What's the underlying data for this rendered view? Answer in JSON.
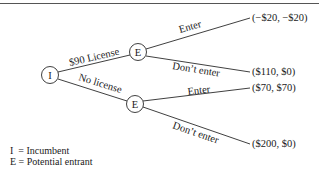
{
  "diagram": {
    "type": "game-tree",
    "nodes": {
      "root": {
        "label": "I"
      },
      "upper": {
        "label": "E"
      },
      "lower": {
        "label": "E"
      }
    },
    "branches": {
      "license": "$90 License",
      "no_license": "No license",
      "upper_enter": "Enter",
      "upper_dont": "Don’t enter",
      "lower_enter": "Enter",
      "lower_dont": "Don’t enter"
    },
    "payoffs": {
      "license_enter": "(−$20, −$20)",
      "license_dont": "($110, $0)",
      "nolicense_enter": "($70, $70)",
      "nolicense_dont": "($200, $0)"
    },
    "legend": [
      "I  = Incumbent",
      "E = Potential entrant"
    ]
  }
}
